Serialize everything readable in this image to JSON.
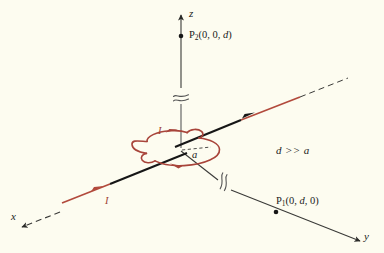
{
  "figure": {
    "background_color": "#fdfcf0",
    "colors": {
      "axis": "#3a3a38",
      "wire_near": "#161616",
      "wire_far": "#b24a3c",
      "loop": "#a8443a",
      "label": "#1a1a1a",
      "current_label": "#9e3f35"
    },
    "axes": [
      {
        "name": "x",
        "label": "x",
        "style": "dashed",
        "direction": "lower-left"
      },
      {
        "name": "y",
        "label": "y",
        "style": "solid",
        "direction": "lower-right"
      },
      {
        "name": "z",
        "label": "z",
        "style": "solid",
        "direction": "up"
      }
    ],
    "points": [
      {
        "name": "P2",
        "symbol": "P",
        "subscript": "2",
        "coords": "(0, 0, d)",
        "label": "P₂(0, 0, d)",
        "on_axis": "z"
      },
      {
        "name": "P1",
        "symbol": "P",
        "subscript": "1",
        "coords": "(0, d, 0)",
        "label": "P₁(0, d, 0)",
        "on_axis": "y"
      }
    ],
    "annotations": {
      "condition": "d >> a",
      "condition_parts": {
        "lhs": "d",
        "operator": ">>",
        "rhs": "a"
      },
      "radius_label": "a",
      "current_label_top": "I",
      "current_label_wire": "I"
    },
    "loop": {
      "shape": "ellipse",
      "radius_label": "a",
      "current_direction": "counterclockwise-viewed-from-above",
      "arrow_count": 2
    },
    "wire": {
      "description": "long straight wire along the x-y diagonal carrying current I",
      "current_label": "I",
      "break_symbols": 2
    }
  }
}
